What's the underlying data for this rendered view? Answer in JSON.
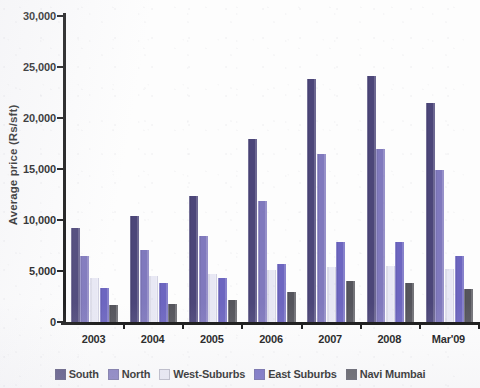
{
  "chart_data": {
    "type": "bar",
    "title": "",
    "xlabel": "",
    "ylabel": "Average price (Rs/sft)",
    "categories": [
      "2003",
      "2004",
      "2005",
      "2006",
      "2007",
      "2008",
      "Mar'09"
    ],
    "ylim": [
      0,
      30000
    ],
    "ytick_labels": [
      "0",
      "5,000",
      "10,000",
      "15,000",
      "20,000",
      "25,000",
      "30,000"
    ],
    "ytick_values": [
      0,
      5000,
      10000,
      15000,
      20000,
      25000,
      30000
    ],
    "grid": "horizontal-dotted",
    "legend_position": "bottom",
    "series": [
      {
        "name": "South",
        "color": "#4c4679",
        "values": [
          9200,
          10400,
          12400,
          17900,
          23800,
          24100,
          21500
        ]
      },
      {
        "name": "North",
        "color": "#8079bd",
        "values": [
          6500,
          7100,
          8400,
          11900,
          16500,
          17000,
          14900
        ]
      },
      {
        "name": "West-Suburbs",
        "color": "#e8e8f4",
        "values": [
          4300,
          4500,
          4700,
          5100,
          5400,
          5500,
          5200
        ]
      },
      {
        "name": "East Suburbs",
        "color": "#6d66c0",
        "values": [
          3300,
          3800,
          4300,
          5700,
          7800,
          7800,
          6500
        ]
      },
      {
        "name": "Navi Mumbai",
        "color": "#55555c",
        "values": [
          1700,
          1800,
          2200,
          2900,
          4000,
          3800,
          3200
        ]
      }
    ]
  }
}
